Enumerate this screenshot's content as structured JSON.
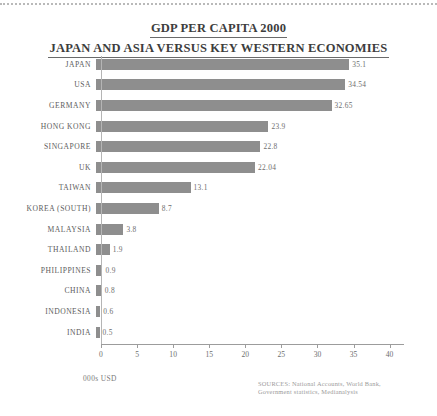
{
  "title": {
    "line1": "GDP PER CAPITA 2000",
    "line2": "JAPAN AND ASIA VERSUS KEY WESTERN ECONOMIES"
  },
  "axis_caption": "000s USD",
  "source_note": {
    "line1": "SOURCES: National Accounts, World Bank,",
    "line2": "Government statistics, Medianalysis"
  },
  "colors": {
    "bar": "#8e8e8e",
    "axis": "#9c9c9c",
    "text": "#5d5d5d",
    "title": "#3d3d3d",
    "source": "#9b9b9b"
  },
  "chart_data": {
    "type": "bar",
    "orientation": "horizontal",
    "xlabel": "000s USD",
    "ylabel": "",
    "xlim": [
      0,
      42
    ],
    "xticks": [
      0,
      5,
      10,
      15,
      20,
      25,
      30,
      35,
      40
    ],
    "xtick_labels": [
      "0",
      "5",
      "10",
      "15",
      "20",
      "25",
      "30",
      "35",
      "40"
    ],
    "grid": false,
    "legend": false,
    "categories": [
      "JAPAN",
      "USA",
      "GERMANY",
      "HONG KONG",
      "SINGAPORE",
      "UK",
      "TAIWAN",
      "KOREA (SOUTH)",
      "MALAYSIA",
      "THAILAND",
      "PHILIPPINES",
      "CHINA",
      "INDONESIA",
      "INDIA"
    ],
    "values": [
      35.1,
      34.54,
      32.65,
      23.9,
      22.8,
      22.04,
      13.1,
      8.7,
      3.8,
      1.9,
      0.9,
      0.8,
      0.6,
      0.5
    ],
    "value_labels": [
      "35.1",
      "34.54",
      "32.65",
      "23.9",
      "22.8",
      "22.04",
      "13.1",
      "8.7",
      "3.8",
      "1.9",
      "0.9",
      "0.8",
      "0.6",
      "0.5"
    ]
  }
}
